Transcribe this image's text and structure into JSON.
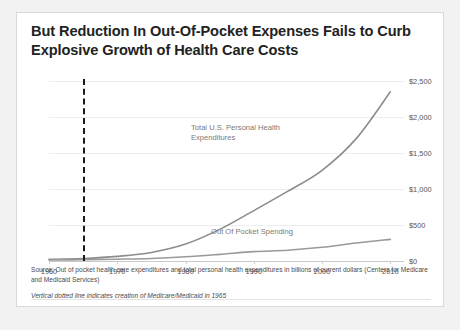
{
  "slide": {
    "title": "But Reduction In Out-Of-Pocket Expenses Fails to Curb Explosive Growth of Health Care Costs",
    "notes": {
      "source": "Source: Out of pocket health care expenditures and total  personal health expenditures in  billions of current dollars (Centers for Medicare and Medicaid Services)",
      "footnote": "Vertical dotted line indicates creation of Medicare/Medicaid  in 1965"
    }
  },
  "chart_data": {
    "type": "line",
    "title": "But Reduction In Out-Of-Pocket Expenses Fails to Curb Explosive Growth of Health Care Costs",
    "xlabel": "",
    "ylabel": "",
    "xlim": [
      1960,
      2012
    ],
    "ylim": [
      0,
      2500
    ],
    "yticks": [
      0,
      500,
      1000,
      1500,
      2000,
      2500
    ],
    "ytick_labels": [
      "$0",
      "$500",
      "$1,000",
      "$1,500",
      "$2,000",
      "$2,500"
    ],
    "xticks": [
      1960,
      1970,
      1980,
      1990,
      2000,
      2010
    ],
    "xtick_labels": [
      "1960",
      "1970",
      "1980",
      "1990",
      "2000",
      "2010"
    ],
    "grid": true,
    "legend": "inline-annotations",
    "x": [
      1960,
      1965,
      1970,
      1975,
      1980,
      1985,
      1990,
      1995,
      2000,
      2005,
      2010
    ],
    "series": [
      {
        "name": "Total U.S. Personal Health\nExpenditures",
        "color": "#8c8c8c",
        "values": [
          23,
          35,
          64,
          119,
          235,
          439,
          700,
          970,
          1260,
          1700,
          2350
        ]
      },
      {
        "name": "Out Of Pocket Spending",
        "color": "#9a9a9a",
        "values": [
          13,
          18,
          25,
          35,
          58,
          92,
          130,
          150,
          190,
          250,
          300
        ]
      }
    ],
    "annotations": [
      {
        "text": "Total U.S. Personal Health\nExpenditures",
        "x": 1984,
        "y": 1420
      },
      {
        "text": "Out Of Pocket Spending",
        "x": 1988,
        "y": 470
      }
    ],
    "reference_line": {
      "type": "vertical-dashed",
      "x": 1965,
      "label": "Creation of Medicare/Medicaid in 1965",
      "color": "#1a1a1a"
    }
  }
}
